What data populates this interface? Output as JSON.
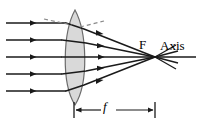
{
  "figure": {
    "width": 202,
    "height": 123,
    "background_color": "#ffffff",
    "line_color": "#1a1a1a",
    "lens_fill_color": "#d9d9d9",
    "lens_stroke_color": "#6b6b6b",
    "dashed_color": "#8a8a8a"
  },
  "labels": {
    "focal_point": "F",
    "axis": "Axis",
    "focal_length": "f"
  },
  "optics": {
    "lens": {
      "type": "biconvex",
      "center_x": 75,
      "top_y": 10,
      "bottom_y": 105,
      "half_thickness": 13
    },
    "focal_point": {
      "x": 155,
      "y": 57
    },
    "focal_length_marker": {
      "from_x": 74,
      "to_x": 155,
      "y": 110
    },
    "incoming_rays_y": [
      23,
      40,
      57,
      74,
      91
    ],
    "incoming_ray_start_x": 6,
    "axis_end_x": 196,
    "ray_count": 5
  }
}
